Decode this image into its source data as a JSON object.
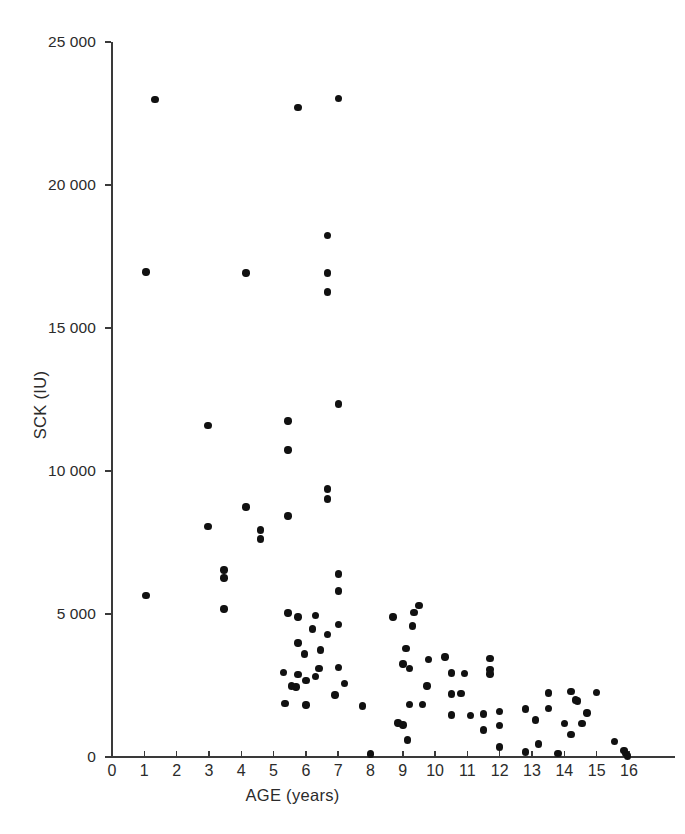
{
  "chart_data": {
    "type": "scatter",
    "title": "",
    "xlabel": "AGE (years)",
    "ylabel": "SCK (IU)",
    "xlim": [
      0,
      16
    ],
    "ylim": [
      0,
      25000
    ],
    "xticks": [
      0,
      1,
      2,
      3,
      4,
      5,
      6,
      7,
      8,
      9,
      10,
      11,
      12,
      13,
      14,
      15,
      16
    ],
    "xticklabels": [
      "0",
      "1",
      "2",
      "3",
      "4",
      "5",
      "6",
      "7",
      "8",
      "9",
      "10",
      "11",
      "12",
      "13",
      "14",
      "15",
      "16"
    ],
    "yticks": [
      0,
      5000,
      10000,
      15000,
      20000,
      25000
    ],
    "yticklabels": [
      "0",
      "5 000",
      "10 000",
      "15 000",
      "20 000",
      "25 000"
    ],
    "grid": false,
    "legend": null,
    "marker": "filled-circle",
    "marker_color": "#111111",
    "axis_color": "#3a3a3a",
    "background": "#ffffff",
    "points": [
      [
        1.33,
        23000
      ],
      [
        5.76,
        22720
      ],
      [
        7.0,
        23030
      ],
      [
        1.05,
        16960
      ],
      [
        4.15,
        16930
      ],
      [
        6.66,
        16930
      ],
      [
        6.66,
        16260
      ],
      [
        6.66,
        18230
      ],
      [
        7.0,
        12340
      ],
      [
        2.97,
        11590
      ],
      [
        5.45,
        11750
      ],
      [
        5.45,
        10730
      ],
      [
        6.66,
        9370
      ],
      [
        6.66,
        9020
      ],
      [
        4.15,
        8740
      ],
      [
        5.45,
        8430
      ],
      [
        2.97,
        8050
      ],
      [
        4.6,
        7940
      ],
      [
        4.6,
        7620
      ],
      [
        3.47,
        6540
      ],
      [
        3.47,
        6260
      ],
      [
        7.0,
        6400
      ],
      [
        7.0,
        5810
      ],
      [
        1.05,
        5650
      ],
      [
        3.47,
        5180
      ],
      [
        5.76,
        4900
      ],
      [
        5.45,
        5030
      ],
      [
        6.3,
        4940
      ],
      [
        6.2,
        4480
      ],
      [
        6.66,
        4290
      ],
      [
        5.76,
        3980
      ],
      [
        6.45,
        3740
      ],
      [
        5.95,
        3600
      ],
      [
        7.0,
        4640
      ],
      [
        7.0,
        3140
      ],
      [
        6.4,
        3090
      ],
      [
        5.3,
        2960
      ],
      [
        5.75,
        2880
      ],
      [
        6.3,
        2820
      ],
      [
        5.55,
        2480
      ],
      [
        5.7,
        2450
      ],
      [
        5.35,
        1870
      ],
      [
        6.0,
        1820
      ],
      [
        7.75,
        1780
      ],
      [
        8.0,
        110
      ],
      [
        8.7,
        4890
      ],
      [
        9.0,
        3250
      ],
      [
        9.35,
        5050
      ],
      [
        9.5,
        5290
      ],
      [
        9.3,
        4580
      ],
      [
        9.1,
        3800
      ],
      [
        9.8,
        3400
      ],
      [
        10.3,
        3490
      ],
      [
        9.2,
        3100
      ],
      [
        10.5,
        2940
      ],
      [
        10.9,
        2930
      ],
      [
        11.7,
        3440
      ],
      [
        11.7,
        3060
      ],
      [
        11.7,
        2900
      ],
      [
        9.75,
        2480
      ],
      [
        10.5,
        2200
      ],
      [
        10.8,
        2210
      ],
      [
        9.2,
        1840
      ],
      [
        9.6,
        1840
      ],
      [
        10.5,
        1470
      ],
      [
        11.1,
        1460
      ],
      [
        11.5,
        1500
      ],
      [
        12.0,
        1600
      ],
      [
        8.85,
        1190
      ],
      [
        9.0,
        1120
      ],
      [
        11.5,
        950
      ],
      [
        12.0,
        1110
      ],
      [
        9.15,
        590
      ],
      [
        12.0,
        350
      ],
      [
        12.8,
        170
      ],
      [
        13.2,
        450
      ],
      [
        13.5,
        2240
      ],
      [
        14.2,
        2290
      ],
      [
        12.8,
        1680
      ],
      [
        13.5,
        1700
      ],
      [
        14.4,
        1960
      ],
      [
        14.35,
        2000
      ],
      [
        15.0,
        2260
      ],
      [
        14.7,
        1540
      ],
      [
        13.1,
        1300
      ],
      [
        14.0,
        1180
      ],
      [
        14.55,
        1180
      ],
      [
        14.2,
        780
      ],
      [
        13.8,
        130
      ],
      [
        15.55,
        540
      ],
      [
        15.85,
        220
      ],
      [
        15.9,
        120
      ],
      [
        15.95,
        40
      ],
      [
        6.9,
        2170
      ],
      [
        7.2,
        2580
      ],
      [
        6.0,
        2680
      ]
    ]
  }
}
